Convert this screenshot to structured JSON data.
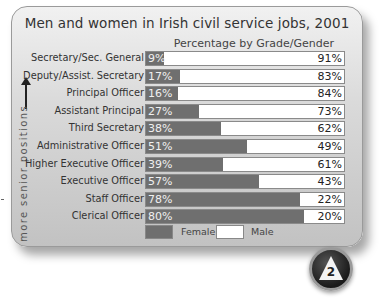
{
  "chart_data": {
    "type": "bar",
    "orientation": "horizontal",
    "stacked": true,
    "title": "Men and women in Irish civil service jobs, 2001",
    "subtitle": "Percentage by Grade/Gender",
    "side_label": "more senior positions",
    "categories": [
      "Secretary/Sec. General",
      "Deputy/Assist. Secretary",
      "Principal Officer",
      "Assistant Principal",
      "Third Secretary",
      "Administrative Officer",
      "Higher Executive Officer",
      "Executive Officer",
      "Staff Officer",
      "Clerical Officer"
    ],
    "series": [
      {
        "name": "Female",
        "color": "#6f6f6f",
        "values": [
          9,
          17,
          16,
          27,
          38,
          51,
          39,
          57,
          78,
          80
        ]
      },
      {
        "name": "Male",
        "color": "#ffffff",
        "values": [
          91,
          83,
          84,
          73,
          62,
          49,
          61,
          43,
          22,
          20
        ]
      }
    ],
    "xlim": [
      0,
      100
    ],
    "legend_position": "bottom",
    "grid": false,
    "badge": "2"
  },
  "rows": [
    {
      "label": "Secretary/Sec. General",
      "female": "9%",
      "male": "91%",
      "fw": "9%"
    },
    {
      "label": "Deputy/Assist. Secretary",
      "female": "17%",
      "male": "83%",
      "fw": "17%"
    },
    {
      "label": "Principal Officer",
      "female": "16%",
      "male": "84%",
      "fw": "16%"
    },
    {
      "label": "Assistant Principal",
      "female": "27%",
      "male": "73%",
      "fw": "27%"
    },
    {
      "label": "Third Secretary",
      "female": "38%",
      "male": "62%",
      "fw": "38%"
    },
    {
      "label": "Administrative Officer",
      "female": "51%",
      "male": "49%",
      "fw": "51%"
    },
    {
      "label": "Higher Executive Officer",
      "female": "39%",
      "male": "61%",
      "fw": "39%"
    },
    {
      "label": "Executive Officer",
      "female": "57%",
      "male": "43%",
      "fw": "57%"
    },
    {
      "label": "Staff Officer",
      "female": "78%",
      "male": "22%",
      "fw": "78%"
    },
    {
      "label": "Clerical Officer",
      "female": "80%",
      "male": "20%",
      "fw": "80%"
    }
  ],
  "legend": {
    "female": "Female",
    "male": "Male"
  }
}
